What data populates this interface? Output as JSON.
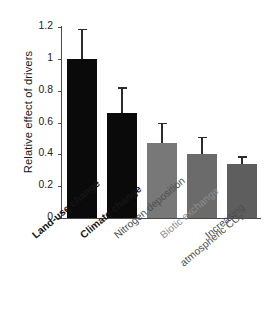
{
  "chart_data": {
    "type": "bar",
    "title": "",
    "subtitle": "",
    "xlabel": "",
    "ylabel": "Relative effect of drivers",
    "ylim": [
      0,
      1.2
    ],
    "yticks": [
      "0",
      "0.2",
      "0.4",
      "0.6",
      "0.8",
      "1",
      "1.2"
    ],
    "ytick_values": [
      0,
      0.2,
      0.4,
      0.6,
      0.8,
      1.0,
      1.2
    ],
    "grid": false,
    "legend": "none",
    "categories": [
      "Land-use change",
      "Climate change",
      "Nitrogen deposition",
      "Biotic exchange",
      "Increasing atmospheric CO2"
    ],
    "values": [
      1.0,
      0.66,
      0.47,
      0.4,
      0.34
    ],
    "error_upper": [
      1.18,
      0.81,
      0.59,
      0.5,
      0.38
    ],
    "error_bar_style": "upper-whisker-only",
    "bar_colors": [
      "#0a0a0a",
      "#0a0a0a",
      "#787878",
      "#6b6b6b",
      "#5e5e5e"
    ],
    "label_colors": [
      "#151515",
      "#151515",
      "#4d4d4d",
      "#8e8e8e",
      "#4d4d4d"
    ]
  },
  "axis": {
    "y_title": "Relative effect of drivers",
    "tick_0": "0",
    "tick_1": "0.2",
    "tick_2": "0.4",
    "tick_3": "0.6",
    "tick_4": "0.8",
    "tick_5": "1",
    "tick_6": "1.2"
  },
  "xlabels": {
    "l0": "Land-use change",
    "l1": "Climate change",
    "l2": "Nitrogen deposition",
    "l3": "Biotic exchange",
    "l4_line1": "Increasing",
    "l4_line2_pre": "atmospheric CO",
    "l4_line2_sub": "2"
  }
}
